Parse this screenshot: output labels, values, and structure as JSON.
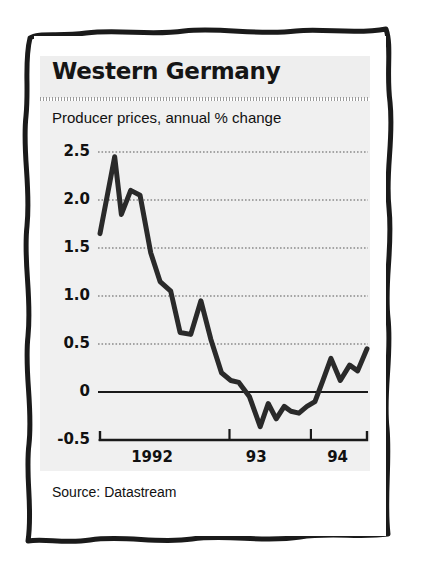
{
  "card": {
    "title": "Western Germany",
    "subtitle": "Producer prices, annual % change",
    "source": "Source: Datastream"
  },
  "colors": {
    "panel_background": "#f0f0f0",
    "title_background": "#eeeeee",
    "ink": "#1a1a1a",
    "gridline": "#8a8a8a",
    "line": "#2a2a2a",
    "page": "#ffffff"
  },
  "chart_data": {
    "type": "line",
    "title": "Western Germany",
    "subtitle": "Producer prices, annual % change",
    "xlabel": "",
    "ylabel": "annual % change",
    "source": "Source: Datastream",
    "ylim": [
      -0.5,
      2.5
    ],
    "yticks": [
      2.5,
      2.0,
      1.5,
      1.0,
      0.5,
      0,
      -0.5
    ],
    "ytick_labels": [
      "2.5",
      "2.0",
      "1.5",
      "1.0",
      "0.5",
      "0",
      "-0.5"
    ],
    "xtick_labels": [
      "1992",
      "93",
      "94"
    ],
    "xtick_positions": [
      0.195,
      0.585,
      0.89
    ],
    "grid": true,
    "gridline_style": "dotted",
    "zero_line": true,
    "legend": null,
    "series": [
      {
        "name": "Producer prices, annual % change",
        "x": [
          0.0,
          0.055,
          0.08,
          0.115,
          0.15,
          0.19,
          0.225,
          0.265,
          0.3,
          0.34,
          0.378,
          0.415,
          0.455,
          0.49,
          0.52,
          0.56,
          0.6,
          0.63,
          0.66,
          0.69,
          0.715,
          0.745,
          0.775,
          0.805,
          0.835,
          0.865,
          0.9,
          0.935,
          0.965,
          1.0
        ],
        "values": [
          1.65,
          2.45,
          1.85,
          2.1,
          2.05,
          1.45,
          1.15,
          1.05,
          0.62,
          0.6,
          0.95,
          0.55,
          0.2,
          0.12,
          0.1,
          -0.05,
          -0.36,
          -0.12,
          -0.28,
          -0.15,
          -0.2,
          -0.22,
          -0.15,
          -0.1,
          0.12,
          0.35,
          0.12,
          0.28,
          0.22,
          0.45
        ]
      }
    ]
  }
}
